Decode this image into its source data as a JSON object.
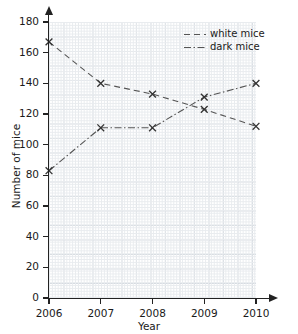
{
  "title": {
    "text": ""
  },
  "axes": {
    "x_label": "Year",
    "y_label": "Number of mice",
    "x_ticks": [
      "2006",
      "2007",
      "2008",
      "2009",
      "2010"
    ],
    "y_ticks": [
      "0",
      "20",
      "40",
      "60",
      "80",
      "100",
      "120",
      "140",
      "160",
      "180"
    ]
  },
  "legend": {
    "position": "top-right",
    "entries": [
      {
        "label": "white mice",
        "dash": "dashed",
        "color": "#555555"
      },
      {
        "label": "dark mice",
        "dash": "dash-dot",
        "color": "#555555"
      }
    ]
  },
  "colors": {
    "line": "#555555",
    "marker": "#333333",
    "axis": "#222222",
    "grid_minor": "#e9ecef",
    "grid_major": "#d3d8de",
    "background": "#ffffff"
  },
  "chart_data": {
    "type": "line",
    "title": "",
    "xlabel": "Year",
    "ylabel": "Number of mice",
    "x": [
      2006,
      2007,
      2008,
      2009,
      2010
    ],
    "categories": [
      "2006",
      "2007",
      "2008",
      "2009",
      "2010"
    ],
    "xlim": [
      2006,
      2010
    ],
    "ylim": [
      0,
      180
    ],
    "y_tick_step": 20,
    "grid": true,
    "legend_position": "top-right",
    "marker": "x",
    "series": [
      {
        "name": "white mice",
        "dash": "dashed",
        "values": [
          167,
          140,
          133,
          123,
          112
        ]
      },
      {
        "name": "dark mice",
        "dash": "dash-dot",
        "values": [
          83,
          111,
          111,
          131,
          140
        ]
      }
    ]
  }
}
